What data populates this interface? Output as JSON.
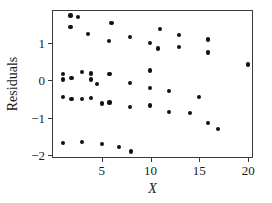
{
  "chart_data": {
    "type": "scatter",
    "title": "",
    "xlabel": "X",
    "ylabel": "Residuals",
    "xlim": [
      0.0,
      20.6
    ],
    "ylim": [
      -2.1,
      1.85
    ],
    "grid": false,
    "legend": null,
    "x_ticks": [
      5,
      10,
      15,
      20
    ],
    "x_tick_labels": [
      "5",
      "10",
      "15",
      "20"
    ],
    "y_ticks": [
      1,
      0,
      -1,
      -2
    ],
    "y_tick_labels": [
      "1",
      "0",
      "−1",
      "−2"
    ],
    "marker": "filled-circle",
    "marker_color": "#111111",
    "points": [
      {
        "x": 1.0,
        "y": -0.44
      },
      {
        "x": 1.0,
        "y": 0.02
      },
      {
        "x": 1.0,
        "y": 0.17
      },
      {
        "x": 1.0,
        "y": -1.67
      },
      {
        "x": 1.8,
        "y": 1.73
      },
      {
        "x": 1.8,
        "y": 1.42
      },
      {
        "x": 1.9,
        "y": 0.07
      },
      {
        "x": 1.9,
        "y": -0.5
      },
      {
        "x": 2.6,
        "y": 1.7
      },
      {
        "x": 3.0,
        "y": 0.22
      },
      {
        "x": 3.0,
        "y": -0.5
      },
      {
        "x": 3.0,
        "y": -1.65
      },
      {
        "x": 3.6,
        "y": 1.23
      },
      {
        "x": 3.9,
        "y": 0.18
      },
      {
        "x": 3.9,
        "y": 0.02
      },
      {
        "x": 3.9,
        "y": -0.47
      },
      {
        "x": 4.5,
        "y": -0.09
      },
      {
        "x": 5.0,
        "y": -0.62
      },
      {
        "x": 5.0,
        "y": -1.7
      },
      {
        "x": 5.7,
        "y": 1.04
      },
      {
        "x": 5.8,
        "y": 0.16
      },
      {
        "x": 5.8,
        "y": -0.59
      },
      {
        "x": 6.0,
        "y": 1.53
      },
      {
        "x": 6.8,
        "y": -1.78
      },
      {
        "x": 7.9,
        "y": 1.16
      },
      {
        "x": 7.9,
        "y": -0.08
      },
      {
        "x": 7.9,
        "y": -0.72
      },
      {
        "x": 8.0,
        "y": -1.9
      },
      {
        "x": 9.9,
        "y": 1.0
      },
      {
        "x": 9.9,
        "y": 0.26
      },
      {
        "x": 9.9,
        "y": -0.21
      },
      {
        "x": 9.9,
        "y": -0.67
      },
      {
        "x": 10.8,
        "y": 0.85
      },
      {
        "x": 11.0,
        "y": 1.37
      },
      {
        "x": 11.9,
        "y": -0.29
      },
      {
        "x": 11.9,
        "y": -0.84
      },
      {
        "x": 12.9,
        "y": 1.2
      },
      {
        "x": 12.9,
        "y": 0.88
      },
      {
        "x": 14.0,
        "y": -0.88
      },
      {
        "x": 15.0,
        "y": -0.44
      },
      {
        "x": 15.9,
        "y": 1.09
      },
      {
        "x": 15.9,
        "y": 0.74
      },
      {
        "x": 15.9,
        "y": -1.13
      },
      {
        "x": 16.9,
        "y": -1.3
      },
      {
        "x": 20.0,
        "y": 0.42
      }
    ]
  }
}
